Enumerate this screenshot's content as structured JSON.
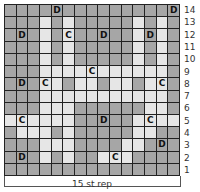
{
  "chart": {
    "title": "",
    "repeat_label": "15 st rep",
    "columns": 15,
    "rows": 14,
    "colors": {
      "dark": "#a6a6a6",
      "light": "#e6e6e6",
      "grid_line": "#222222"
    },
    "legend_symbols": [
      "D",
      "C"
    ],
    "row_numbers": [
      "14",
      "13",
      "12",
      "11",
      "10",
      "9",
      "8",
      "7",
      "6",
      "5",
      "4",
      "3",
      "2",
      "1"
    ],
    "grid": [
      {
        "row": "14",
        "cells": [
          "d",
          "d",
          "d",
          "d",
          "d:D",
          "d",
          "d",
          "d",
          "d",
          "d",
          "d",
          "d",
          "d",
          "d",
          "d:D"
        ]
      },
      {
        "row": "13",
        "cells": [
          "d",
          "d",
          "d",
          "l",
          "d",
          "l",
          "d",
          "d",
          "d",
          "d",
          "d",
          "l",
          "d",
          "l",
          "d"
        ]
      },
      {
        "row": "12",
        "cells": [
          "d",
          "d:D",
          "d",
          "l",
          "d",
          "l:C",
          "d",
          "d",
          "d:D",
          "d",
          "d",
          "l",
          "d:D",
          "l",
          "d"
        ]
      },
      {
        "row": "11",
        "cells": [
          "d",
          "d",
          "d",
          "l",
          "d",
          "l",
          "d",
          "d",
          "d",
          "d",
          "d",
          "l",
          "d",
          "l",
          "d"
        ]
      },
      {
        "row": "10",
        "cells": [
          "d",
          "d",
          "d",
          "l",
          "d",
          "l",
          "d",
          "d",
          "d",
          "d",
          "d",
          "l",
          "d",
          "l",
          "d"
        ]
      },
      {
        "row": "9",
        "cells": [
          "d",
          "d",
          "d",
          "l",
          "l",
          "l",
          "l",
          "l:C",
          "l",
          "l",
          "l",
          "l",
          "l",
          "l",
          "d"
        ]
      },
      {
        "row": "8",
        "cells": [
          "d",
          "d:D",
          "d",
          "l:C",
          "l",
          "d",
          "l",
          "l",
          "d",
          "l",
          "l",
          "d",
          "l",
          "l:C",
          "d"
        ]
      },
      {
        "row": "7",
        "cells": [
          "d",
          "d",
          "d",
          "l",
          "l",
          "l",
          "l",
          "l",
          "l",
          "l",
          "l",
          "l",
          "l",
          "l",
          "d"
        ]
      },
      {
        "row": "6",
        "cells": [
          "d",
          "d",
          "d",
          "l",
          "l",
          "l",
          "d",
          "d",
          "d",
          "d",
          "d",
          "d",
          "l",
          "l",
          "d"
        ]
      },
      {
        "row": "5",
        "cells": [
          "l",
          "l:C",
          "l",
          "l",
          "l",
          "l",
          "d",
          "d",
          "d:D",
          "d",
          "d",
          "l",
          "l:C",
          "l",
          "l"
        ]
      },
      {
        "row": "4",
        "cells": [
          "d",
          "l",
          "l",
          "l",
          "d",
          "l",
          "d",
          "d",
          "d",
          "d",
          "d",
          "l",
          "l",
          "d",
          "d"
        ]
      },
      {
        "row": "3",
        "cells": [
          "d",
          "d",
          "d",
          "l",
          "l",
          "l",
          "d",
          "d",
          "d",
          "d",
          "l",
          "l",
          "d",
          "d:D",
          "d"
        ]
      },
      {
        "row": "2",
        "cells": [
          "d",
          "d:D",
          "d",
          "l",
          "d",
          "l",
          "d",
          "d",
          "l",
          "l:C",
          "l",
          "d",
          "d",
          "d",
          "d"
        ]
      },
      {
        "row": "1",
        "cells": [
          "d",
          "d",
          "d",
          "d",
          "d",
          "d",
          "d",
          "d",
          "d",
          "d",
          "d",
          "d",
          "d",
          "d",
          "d"
        ]
      }
    ]
  }
}
